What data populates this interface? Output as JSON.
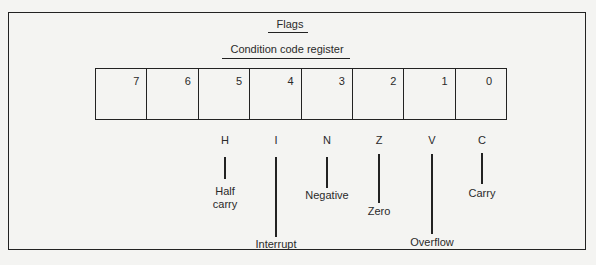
{
  "diagram": {
    "title": "Flags",
    "subtitle": "Condition code register",
    "bits": [
      "7",
      "6",
      "5",
      "4",
      "3",
      "2",
      "1",
      "0"
    ],
    "flags": [
      {
        "letter": "H",
        "name": "Half carry",
        "name_line1": "Half",
        "name_line2": "carry",
        "bit": "5"
      },
      {
        "letter": "I",
        "name": "Interrupt",
        "bit": "4"
      },
      {
        "letter": "N",
        "name": "Negative",
        "bit": "3"
      },
      {
        "letter": "Z",
        "name": "Zero",
        "bit": "2"
      },
      {
        "letter": "V",
        "name": "Overflow",
        "bit": "1"
      },
      {
        "letter": "C",
        "name": "Carry",
        "bit": "0"
      }
    ]
  }
}
